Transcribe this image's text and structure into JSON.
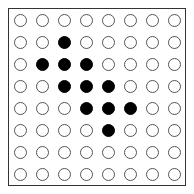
{
  "board": {
    "rows": 8,
    "cols": 8,
    "cells": [
      [
        0,
        0,
        0,
        0,
        0,
        0,
        0,
        0
      ],
      [
        0,
        0,
        1,
        0,
        0,
        0,
        0,
        0
      ],
      [
        0,
        1,
        1,
        1,
        0,
        0,
        0,
        0
      ],
      [
        0,
        0,
        1,
        1,
        1,
        0,
        0,
        0
      ],
      [
        0,
        0,
        0,
        1,
        1,
        1,
        0,
        0
      ],
      [
        0,
        0,
        0,
        0,
        1,
        0,
        0,
        0
      ],
      [
        0,
        0,
        0,
        0,
        0,
        0,
        0,
        0
      ],
      [
        0,
        0,
        0,
        0,
        0,
        0,
        0,
        0
      ]
    ],
    "colors": {
      "filled": "#000000",
      "empty": "#ffffff",
      "outline": "#555555",
      "border": "#333333"
    }
  }
}
